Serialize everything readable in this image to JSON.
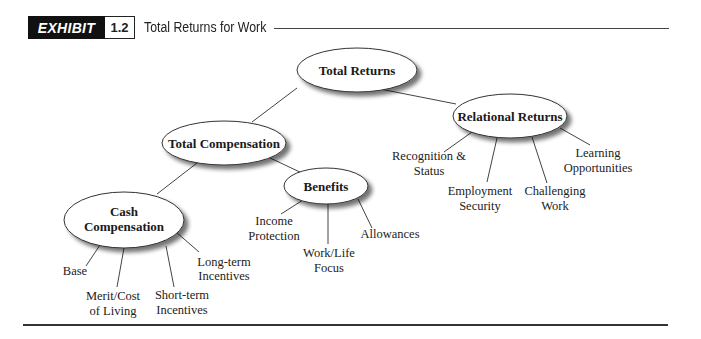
{
  "header": {
    "exhibit_label": "EXHIBIT",
    "exhibit_number": "1.2",
    "title": "Total Returns for Work"
  },
  "diagram": {
    "root": {
      "label": "Total Returns"
    },
    "nodes": {
      "total_compensation": {
        "label": "Total Compensation"
      },
      "relational_returns": {
        "label": "Relational Returns"
      },
      "benefits": {
        "label": "Benefits"
      },
      "cash_compensation": {
        "line1": "Cash",
        "line2": "Compensation"
      }
    },
    "leaves": {
      "recognition": {
        "line1": "Recognition &",
        "line2": "Status"
      },
      "employment": {
        "line1": "Employment",
        "line2": "Security"
      },
      "challenging": {
        "line1": "Challenging",
        "line2": "Work"
      },
      "learning": {
        "line1": "Learning",
        "line2": "Opportunities"
      },
      "income": {
        "line1": "Income",
        "line2": "Protection"
      },
      "worklife": {
        "line1": "Work/Life",
        "line2": "Focus"
      },
      "allowances": {
        "line1": "Allowances"
      },
      "base": {
        "line1": "Base"
      },
      "merit": {
        "line1": "Merit/Cost",
        "line2": "of Living"
      },
      "shortterm": {
        "line1": "Short-term",
        "line2": "Incentives"
      },
      "longterm": {
        "line1": "Long-term",
        "line2": "Incentives"
      }
    },
    "hierarchy": {
      "Total Returns": [
        "Total Compensation",
        "Relational Returns"
      ],
      "Total Compensation": [
        "Cash Compensation",
        "Benefits"
      ],
      "Relational Returns": [
        "Recognition & Status",
        "Employment Security",
        "Challenging Work",
        "Learning Opportunities"
      ],
      "Benefits": [
        "Income Protection",
        "Work/Life Focus",
        "Allowances"
      ],
      "Cash Compensation": [
        "Base",
        "Merit/Cost of Living",
        "Short-term Incentives",
        "Long-term Incentives"
      ]
    }
  }
}
